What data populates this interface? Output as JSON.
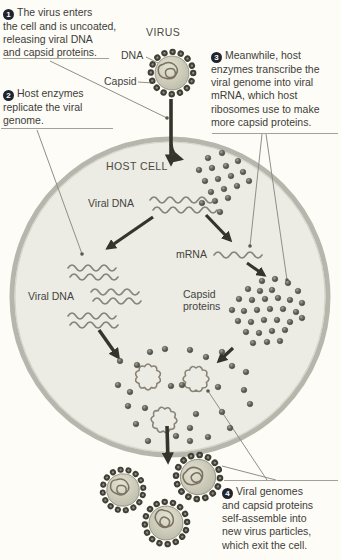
{
  "steps": [
    {
      "number": "1",
      "text": "The virus enters\nthe cell and is uncoated,\nreleasing viral DNA\nand capsid proteins."
    },
    {
      "number": "2",
      "text": "Host enzymes\nreplicate the viral\ngenome."
    },
    {
      "number": "3",
      "text": "Meanwhile, host\nenzymes transcribe the\nviral genome into viral\nmRNA, which host\nribosomes use to make\nmore capsid proteins."
    },
    {
      "number": "4",
      "text": "Viral genomes\nand capsid proteins\nself-assemble into\nnew virus particles,\nwhich exit the cell."
    }
  ],
  "labels": {
    "virus": "VIRUS",
    "dna": "DNA",
    "capsid": "Capsid",
    "host_cell": "HOST CELL",
    "viral_dna_top": "Viral DNA",
    "viral_dna_replicated": "Viral DNA",
    "mrna": "mRNA",
    "capsid_proteins": "Capsid proteins"
  },
  "colors": {
    "background": "#fdfcf6",
    "text": "#3d3d3b",
    "badge": "#20242e",
    "cell_fill": "#ecebe4",
    "membrane": "#b7b6ad",
    "arrow": "#35342c",
    "capsid_dot": "#4b4a40",
    "genome_wave": "#84837a"
  }
}
